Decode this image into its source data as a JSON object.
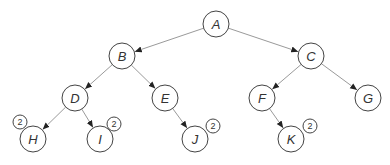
{
  "diagram": {
    "type": "binary-tree",
    "colors": {
      "edge": "#9a9a9a",
      "arrow": "#222222",
      "node_stroke": "#444444",
      "text": "#333333",
      "background": "#ffffff"
    },
    "nodes": [
      {
        "id": "A",
        "label": "A",
        "x": 216,
        "y": 24
      },
      {
        "id": "B",
        "label": "B",
        "x": 122,
        "y": 56
      },
      {
        "id": "C",
        "label": "C",
        "x": 311,
        "y": 56
      },
      {
        "id": "D",
        "label": "D",
        "x": 75,
        "y": 98
      },
      {
        "id": "E",
        "label": "E",
        "x": 165,
        "y": 98
      },
      {
        "id": "F",
        "label": "F",
        "x": 262,
        "y": 98
      },
      {
        "id": "G",
        "label": "G",
        "x": 368,
        "y": 98
      },
      {
        "id": "H",
        "label": "H",
        "x": 33,
        "y": 139,
        "badge": "2",
        "badge_x": 20,
        "badge_y": 122
      },
      {
        "id": "I",
        "label": "I",
        "x": 100,
        "y": 139,
        "badge": "2",
        "badge_x": 114,
        "badge_y": 124
      },
      {
        "id": "J",
        "label": "J",
        "x": 195,
        "y": 139,
        "badge": "2",
        "badge_x": 213,
        "badge_y": 126
      },
      {
        "id": "K",
        "label": "K",
        "x": 291,
        "y": 139,
        "badge": "2",
        "badge_x": 310,
        "badge_y": 126
      }
    ],
    "edges": [
      {
        "from": "A",
        "to": "B"
      },
      {
        "from": "A",
        "to": "C"
      },
      {
        "from": "B",
        "to": "D"
      },
      {
        "from": "B",
        "to": "E"
      },
      {
        "from": "C",
        "to": "F"
      },
      {
        "from": "C",
        "to": "G"
      },
      {
        "from": "D",
        "to": "H"
      },
      {
        "from": "D",
        "to": "I"
      },
      {
        "from": "E",
        "to": "J"
      },
      {
        "from": "F",
        "to": "K"
      }
    ]
  }
}
